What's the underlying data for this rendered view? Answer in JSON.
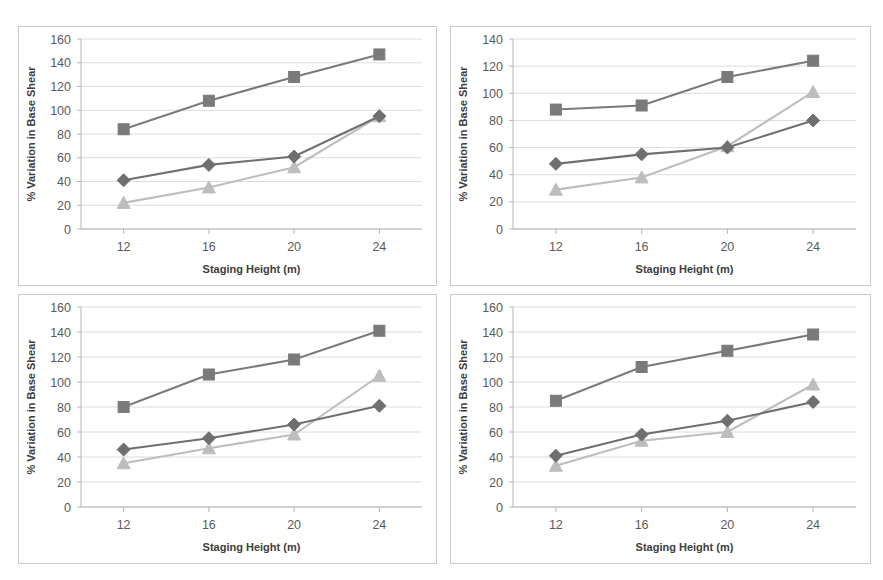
{
  "figure": {
    "panel_count": 4,
    "background_color": "#ffffff",
    "panel_border_color": "#c9c9c9"
  },
  "common": {
    "xlabel": "Staging Height (m)",
    "ylabel": "% Variation in Base Shear",
    "xticks": [
      "12",
      "16",
      "20",
      "24"
    ],
    "series_colors": {
      "square": "#7a7a7a",
      "diamond": "#6f6f6f",
      "triangle": "#bdbdbd"
    },
    "gridline_color": "#dcdcdc",
    "axis_color": "#b5b5b5"
  },
  "chart_data": [
    {
      "id": "panel-top-left",
      "type": "line",
      "title": "",
      "xlabel": "Staging Height (m)",
      "ylabel": "% Variation in Base Shear",
      "categories": [
        12,
        16,
        20,
        24
      ],
      "x": [
        12,
        16,
        20,
        24
      ],
      "xlim": [
        10,
        26
      ],
      "ylim": [
        0,
        160
      ],
      "yticks": [
        0,
        20,
        40,
        60,
        80,
        100,
        120,
        140,
        160
      ],
      "ytick_labels": [
        "0",
        "20",
        "40",
        "60",
        "80",
        "100",
        "120",
        "140",
        "160"
      ],
      "xtick_labels": [
        "12",
        "16",
        "20",
        "24"
      ],
      "grid": true,
      "legend": "none",
      "series": [
        {
          "name": "series-square",
          "marker": "square",
          "color": "#7a7a7a",
          "values": [
            84,
            108,
            128,
            147
          ]
        },
        {
          "name": "series-diamond",
          "marker": "diamond",
          "color": "#6f6f6f",
          "values": [
            41,
            54,
            61,
            95
          ]
        },
        {
          "name": "series-triangle",
          "marker": "triangle",
          "color": "#bdbdbd",
          "values": [
            22,
            35,
            52,
            95
          ]
        }
      ]
    },
    {
      "id": "panel-top-right",
      "type": "line",
      "title": "",
      "xlabel": "Staging Height (m)",
      "ylabel": "% Variation in Base Shear",
      "categories": [
        12,
        16,
        20,
        24
      ],
      "x": [
        12,
        16,
        20,
        24
      ],
      "xlim": [
        10,
        26
      ],
      "ylim": [
        0,
        140
      ],
      "yticks": [
        0,
        20,
        40,
        60,
        80,
        100,
        120,
        140
      ],
      "ytick_labels": [
        "0",
        "20",
        "40",
        "60",
        "80",
        "100",
        "120",
        "140"
      ],
      "xtick_labels": [
        "12",
        "16",
        "20",
        "24"
      ],
      "grid": true,
      "legend": "none",
      "series": [
        {
          "name": "series-square",
          "marker": "square",
          "color": "#7a7a7a",
          "values": [
            88,
            91,
            112,
            124
          ]
        },
        {
          "name": "series-diamond",
          "marker": "diamond",
          "color": "#6f6f6f",
          "values": [
            48,
            55,
            60,
            80
          ]
        },
        {
          "name": "series-triangle",
          "marker": "triangle",
          "color": "#bdbdbd",
          "values": [
            29,
            38,
            61,
            101
          ]
        }
      ]
    },
    {
      "id": "panel-bottom-left",
      "type": "line",
      "title": "",
      "xlabel": "Staging Height (m)",
      "ylabel": "% Variation in Base Shear",
      "categories": [
        12,
        16,
        20,
        24
      ],
      "x": [
        12,
        16,
        20,
        24
      ],
      "xlim": [
        10,
        26
      ],
      "ylim": [
        0,
        160
      ],
      "yticks": [
        0,
        20,
        40,
        60,
        80,
        100,
        120,
        140,
        160
      ],
      "ytick_labels": [
        "0",
        "20",
        "40",
        "60",
        "80",
        "100",
        "120",
        "140",
        "160"
      ],
      "xtick_labels": [
        "12",
        "16",
        "20",
        "24"
      ],
      "grid": true,
      "legend": "none",
      "series": [
        {
          "name": "series-square",
          "marker": "square",
          "color": "#7a7a7a",
          "values": [
            80,
            106,
            118,
            141
          ]
        },
        {
          "name": "series-diamond",
          "marker": "diamond",
          "color": "#6f6f6f",
          "values": [
            46,
            55,
            66,
            81
          ]
        },
        {
          "name": "series-triangle",
          "marker": "triangle",
          "color": "#bdbdbd",
          "values": [
            35,
            47,
            58,
            105
          ]
        }
      ]
    },
    {
      "id": "panel-bottom-right",
      "type": "line",
      "title": "",
      "xlabel": "Staging Height (m)",
      "ylabel": "% Variation in Base Shear",
      "categories": [
        12,
        16,
        20,
        24
      ],
      "x": [
        12,
        16,
        20,
        24
      ],
      "xlim": [
        10,
        26
      ],
      "ylim": [
        0,
        160
      ],
      "yticks": [
        0,
        20,
        40,
        60,
        80,
        100,
        120,
        140,
        160
      ],
      "ytick_labels": [
        "0",
        "20",
        "40",
        "60",
        "80",
        "100",
        "120",
        "140",
        "160"
      ],
      "xtick_labels": [
        "12",
        "16",
        "20",
        "24"
      ],
      "grid": true,
      "legend": "none",
      "series": [
        {
          "name": "series-square",
          "marker": "square",
          "color": "#7a7a7a",
          "values": [
            85,
            112,
            125,
            138
          ]
        },
        {
          "name": "series-diamond",
          "marker": "diamond",
          "color": "#6f6f6f",
          "values": [
            41,
            58,
            69,
            84
          ]
        },
        {
          "name": "series-triangle",
          "marker": "triangle",
          "color": "#bdbdbd",
          "values": [
            33,
            53,
            60,
            98
          ]
        }
      ]
    }
  ]
}
